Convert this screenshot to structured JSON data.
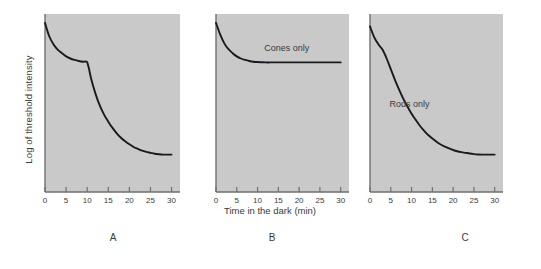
{
  "figure": {
    "xlabel": "Time in the dark (min)",
    "ylabel": "Log of threshold intensity",
    "panel_letters": [
      "A",
      "B",
      "C"
    ],
    "plot_bg": "#c9c9c9",
    "curve_color": "#1a1a1a",
    "axis_color": "#6f6f6f",
    "text_color": "#3a3a3a"
  },
  "chart_data": [
    {
      "type": "line",
      "title": "A",
      "panel": "A",
      "xlabel": "Time in the dark (min)",
      "ylabel": "Log of threshold intensity",
      "xlim": [
        0,
        32
      ],
      "ylim": [
        0,
        10
      ],
      "xticks": [
        0,
        5,
        10,
        15,
        20,
        25,
        30
      ],
      "xticklabels": [
        "0",
        "5",
        "10",
        "15",
        "20",
        "25",
        "30"
      ],
      "yticks": [],
      "yticklabels": [],
      "grid": false,
      "legend": "none",
      "annotations": [],
      "series": [
        {
          "name": "Dark adaptation (rods and cones)",
          "x": [
            0,
            1,
            2,
            3,
            4,
            5,
            6,
            7,
            8,
            9,
            10,
            10.4,
            11,
            12,
            13,
            14,
            15,
            16,
            17,
            18,
            19,
            20,
            21,
            22,
            23,
            24,
            25,
            26,
            27,
            28,
            29,
            30
          ],
          "y": [
            9.5,
            8.75,
            8.3,
            8.0,
            7.8,
            7.62,
            7.5,
            7.42,
            7.36,
            7.32,
            7.3,
            6.95,
            6.3,
            5.5,
            4.85,
            4.35,
            3.95,
            3.6,
            3.3,
            3.05,
            2.85,
            2.68,
            2.53,
            2.42,
            2.32,
            2.25,
            2.2,
            2.15,
            2.12,
            2.1,
            2.1,
            2.1
          ]
        }
      ]
    },
    {
      "type": "line",
      "title": "B",
      "panel": "B",
      "xlabel": "Time in the dark (min)",
      "ylabel": "Log of threshold intensity",
      "xlim": [
        0,
        32
      ],
      "ylim": [
        0,
        10
      ],
      "xticks": [
        0,
        5,
        10,
        15,
        20,
        25,
        30
      ],
      "xticklabels": [
        "0",
        "5",
        "10",
        "15",
        "20",
        "25",
        "30"
      ],
      "yticks": [],
      "yticklabels": [],
      "grid": false,
      "legend": "none",
      "annotations": [
        {
          "text": "Cones only",
          "x": 17,
          "y": 7.9
        }
      ],
      "series": [
        {
          "name": "Cones only",
          "x": [
            0,
            1,
            2,
            3,
            4,
            5,
            6,
            7,
            8,
            9,
            10,
            11,
            12,
            13,
            14,
            15,
            20,
            25,
            30
          ],
          "y": [
            9.5,
            8.85,
            8.35,
            8.02,
            7.8,
            7.62,
            7.5,
            7.42,
            7.36,
            7.32,
            7.3,
            7.29,
            7.28,
            7.28,
            7.28,
            7.28,
            7.28,
            7.28,
            7.28
          ]
        }
      ]
    },
    {
      "type": "line",
      "title": "C",
      "panel": "C",
      "xlabel": "Time in the dark (min)",
      "ylabel": "Log of threshold intensity",
      "xlim": [
        0,
        32
      ],
      "ylim": [
        0,
        10
      ],
      "xticks": [
        0,
        5,
        10,
        15,
        20,
        25,
        30
      ],
      "xticklabels": [
        "0",
        "5",
        "10",
        "15",
        "20",
        "25",
        "30"
      ],
      "yticks": [],
      "yticklabels": [],
      "grid": false,
      "legend": "none",
      "annotations": [
        {
          "text": "Rods only",
          "x": 9.5,
          "y": 4.75
        }
      ],
      "series": [
        {
          "name": "Rods only",
          "x": [
            0,
            1,
            2,
            3,
            4,
            5,
            6,
            7,
            8,
            9,
            10,
            11,
            12,
            13,
            14,
            15,
            16,
            17,
            18,
            19,
            20,
            21,
            22,
            23,
            24,
            25,
            26,
            27,
            28,
            29,
            30
          ],
          "y": [
            9.3,
            8.7,
            8.3,
            8.0,
            7.5,
            6.9,
            6.3,
            5.75,
            5.25,
            4.8,
            4.4,
            4.05,
            3.72,
            3.45,
            3.2,
            3.0,
            2.82,
            2.67,
            2.55,
            2.45,
            2.36,
            2.29,
            2.24,
            2.2,
            2.16,
            2.13,
            2.11,
            2.1,
            2.1,
            2.1,
            2.1
          ]
        }
      ]
    }
  ]
}
